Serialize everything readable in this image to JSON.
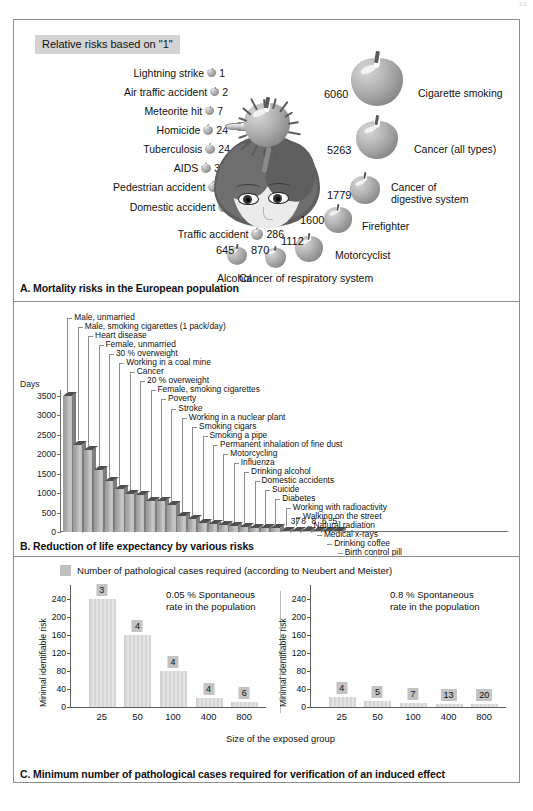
{
  "page_number": "21",
  "panelA": {
    "title": "Relative risks based on \"1\"",
    "caption": "A. Mortality risks in the European population",
    "left_items": [
      {
        "label": "Lightning strike",
        "value": "1"
      },
      {
        "label": "Air traffic accident",
        "value": "2"
      },
      {
        "label": "Meteorite hit",
        "value": "7"
      },
      {
        "label": "Homicide",
        "value": "24"
      },
      {
        "label": "Tuberculosis",
        "value": "24"
      },
      {
        "label": "AIDS",
        "value": "32"
      },
      {
        "label": "Pedestrian accident",
        "value": "47"
      },
      {
        "label": "Domestic accident",
        "value": "182"
      },
      {
        "label": "Traffic accident",
        "value": "286"
      }
    ],
    "right_items": [
      {
        "label": "Cigarette smoking",
        "value": "6060"
      },
      {
        "label": "Cancer (all types)",
        "value": "5263"
      },
      {
        "label": "Cancer of digestive system",
        "value": "1779"
      },
      {
        "label": "Firefighter",
        "value": "1600"
      },
      {
        "label": "Motorcyclist",
        "value": "1112"
      },
      {
        "label": "Cancer of respiratory system",
        "value": "870"
      },
      {
        "label": "Alcohol",
        "value": "645"
      }
    ]
  },
  "panelB": {
    "caption": "B. Reduction of life expectancy by various risks",
    "chart_data": {
      "type": "bar",
      "title": "Reduction of life expectancy by various risks",
      "ylabel": "Days",
      "xlabel": "",
      "ylim": [
        0,
        3500
      ],
      "yticks": [
        "0",
        "500",
        "1000",
        "1500",
        "2000",
        "2500",
        "3000",
        "3500"
      ],
      "grid": false,
      "categories": [
        "Male, unmarried",
        "Male, smoking cigarettes (1 pack/day)",
        "Heart disease",
        "Female, unmarried",
        "30 % overweight",
        "Working in a coal mine",
        "Cancer",
        "20 % overweight",
        "Female, smoking cigarettes",
        "Poverty",
        "Stroke",
        "Working in a nuclear plant",
        "Smoking cigars",
        "Smoking a pipe",
        "Permanent inhalation of fine dust",
        "Motorcycling",
        "Influenza",
        "Drinking alcohol",
        "Domestic accidents",
        "Suicide",
        "Diabetes",
        "Working with radioactivity",
        "Walking on the street",
        "Natural radiation",
        "Medical x-rays",
        "Drinking coffee",
        "Birth control pill"
      ],
      "values": [
        3500,
        2250,
        2100,
        1600,
        1300,
        1100,
        980,
        950,
        800,
        800,
        700,
        400,
        330,
        220,
        200,
        180,
        150,
        130,
        95,
        95,
        95,
        37,
        8,
        8,
        6,
        5,
        5
      ],
      "labeled_values": [
        "37",
        "8",
        "8",
        "6",
        "5"
      ]
    }
  },
  "panelC": {
    "caption": "C. Minimum number of pathological cases required for verification of an induced effect",
    "legend": "Number of pathological cases required (according to Neubert and Meister)",
    "xtitle": "Size of the exposed group",
    "ytitle": "Minimal identifiable risk",
    "chart_data": [
      {
        "type": "bar",
        "title": "0.05 % Spontaneous rate in the population",
        "note_line1": "0.05 % Spontaneous",
        "note_line2": "rate in the population",
        "xlabel": "Size of the exposed group",
        "ylabel": "Minimal identifiable risk",
        "ylim": [
          0,
          260
        ],
        "yticks": [
          "0",
          "40",
          "80",
          "120",
          "160",
          "200",
          "240"
        ],
        "categories": [
          "25",
          "50",
          "100",
          "400",
          "800"
        ],
        "values": [
          240,
          160,
          80,
          20,
          12
        ],
        "point_labels": [
          "3",
          "4",
          "4",
          "4",
          "6"
        ]
      },
      {
        "type": "bar",
        "title": "0.8 % Spontaneous rate in the population",
        "note_line1": "0.8 % Spontaneous",
        "note_line2": "rate in the population",
        "xlabel": "Size of the exposed group",
        "ylabel": "Minimal identifiable risk",
        "ylim": [
          0,
          260
        ],
        "yticks": [
          "0",
          "40",
          "80",
          "120",
          "160",
          "200",
          "240"
        ],
        "categories": [
          "25",
          "50",
          "100",
          "400",
          "800"
        ],
        "values": [
          22,
          13,
          9,
          7,
          5
        ],
        "point_labels": [
          "4",
          "5",
          "7",
          "13",
          "20"
        ]
      }
    ]
  },
  "colors": {
    "frame": "#8d8d8d",
    "title_bg": "#d3d3d3",
    "bar_fill": "#b4b4b4",
    "bar_top": "#4f4f4f",
    "c_bar": "#d7d7d7",
    "c_value_bg": "#c3c3c3"
  }
}
